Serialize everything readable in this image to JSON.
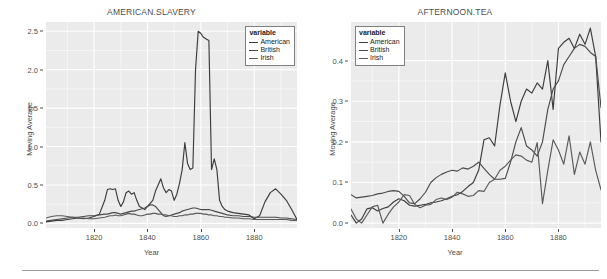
{
  "figure": {
    "divider_visible": true,
    "panel_bg": "#ebebeb",
    "grid_color": "#ffffff",
    "text_color": "#4d4d4d"
  },
  "legend": {
    "title": "variable",
    "entries": [
      {
        "label": "American",
        "color": "#3c3c3c"
      },
      {
        "label": "British",
        "color": "#4a4a4a"
      },
      {
        "label": "Irish",
        "color": "#5a5a5a"
      }
    ]
  },
  "chart_data": [
    {
      "type": "line",
      "title": "AMERICAN.SLAVERY",
      "xlabel": "Year",
      "ylabel": "Moving Average",
      "xlim": [
        1802,
        1896
      ],
      "ylim": [
        -0.06,
        2.62
      ],
      "xticks": [
        1820,
        1840,
        1860,
        1880
      ],
      "yticks": [
        0.0,
        0.5,
        1.0,
        1.5,
        2.0,
        2.5
      ],
      "ytick_labels": [
        "0.0",
        "0.5",
        "1.0",
        "1.5",
        "2.0",
        "2.5"
      ],
      "grid": true,
      "legend_position": "top-right-inside",
      "x": [
        1802,
        1804,
        1806,
        1808,
        1810,
        1812,
        1814,
        1816,
        1818,
        1820,
        1822,
        1824,
        1825,
        1826,
        1827,
        1828,
        1829,
        1830,
        1831,
        1832,
        1833,
        1834,
        1835,
        1836,
        1837,
        1838,
        1839,
        1840,
        1841,
        1842,
        1843,
        1844,
        1845,
        1846,
        1847,
        1848,
        1849,
        1850,
        1851,
        1852,
        1853,
        1854,
        1855,
        1856,
        1857,
        1858,
        1859,
        1860,
        1861,
        1862,
        1863,
        1864,
        1865,
        1866,
        1867,
        1868,
        1869,
        1870,
        1872,
        1874,
        1876,
        1878,
        1880,
        1882,
        1884,
        1886,
        1888,
        1890,
        1892,
        1894,
        1896
      ],
      "series": [
        {
          "name": "American",
          "values": [
            0.02,
            0.03,
            0.04,
            0.04,
            0.05,
            0.06,
            0.07,
            0.06,
            0.07,
            0.09,
            0.12,
            0.3,
            0.44,
            0.45,
            0.44,
            0.45,
            0.3,
            0.22,
            0.28,
            0.4,
            0.42,
            0.38,
            0.4,
            0.3,
            0.22,
            0.2,
            0.18,
            0.22,
            0.26,
            0.3,
            0.42,
            0.5,
            0.58,
            0.46,
            0.4,
            0.44,
            0.42,
            0.3,
            0.38,
            0.52,
            0.7,
            1.05,
            0.78,
            0.7,
            0.72,
            2.0,
            2.5,
            2.47,
            2.42,
            2.4,
            2.38,
            0.7,
            0.84,
            0.7,
            0.3,
            0.22,
            0.18,
            0.16,
            0.14,
            0.13,
            0.12,
            0.11,
            0.06,
            0.1,
            0.28,
            0.4,
            0.45,
            0.38,
            0.3,
            0.18,
            0.05
          ]
        },
        {
          "name": "British",
          "values": [
            0.03,
            0.04,
            0.05,
            0.06,
            0.07,
            0.08,
            0.08,
            0.09,
            0.1,
            0.1,
            0.11,
            0.12,
            0.12,
            0.13,
            0.14,
            0.14,
            0.13,
            0.12,
            0.13,
            0.14,
            0.15,
            0.16,
            0.16,
            0.17,
            0.18,
            0.19,
            0.2,
            0.22,
            0.24,
            0.24,
            0.22,
            0.18,
            0.14,
            0.1,
            0.09,
            0.1,
            0.11,
            0.12,
            0.13,
            0.14,
            0.16,
            0.17,
            0.18,
            0.19,
            0.2,
            0.2,
            0.19,
            0.18,
            0.18,
            0.18,
            0.18,
            0.17,
            0.16,
            0.15,
            0.14,
            0.13,
            0.12,
            0.11,
            0.1,
            0.1,
            0.09,
            0.09,
            0.08,
            0.08,
            0.08,
            0.08,
            0.08,
            0.07,
            0.07,
            0.06,
            0.05
          ]
        },
        {
          "name": "Irish",
          "values": [
            0.07,
            0.09,
            0.1,
            0.1,
            0.09,
            0.08,
            0.07,
            0.07,
            0.06,
            0.06,
            0.07,
            0.08,
            0.09,
            0.1,
            0.1,
            0.11,
            0.1,
            0.1,
            0.11,
            0.12,
            0.13,
            0.12,
            0.12,
            0.11,
            0.1,
            0.1,
            0.11,
            0.12,
            0.12,
            0.13,
            0.13,
            0.12,
            0.12,
            0.11,
            0.11,
            0.1,
            0.1,
            0.09,
            0.09,
            0.1,
            0.1,
            0.11,
            0.11,
            0.12,
            0.12,
            0.13,
            0.13,
            0.13,
            0.12,
            0.12,
            0.11,
            0.11,
            0.1,
            0.1,
            0.09,
            0.09,
            0.08,
            0.08,
            0.07,
            0.07,
            0.06,
            0.06,
            0.05,
            0.05,
            0.05,
            0.05,
            0.05,
            0.05,
            0.05,
            0.04,
            0.04
          ]
        }
      ]
    },
    {
      "type": "line",
      "title": "AFTERNOON.TEA",
      "xlabel": "Year",
      "ylabel": "Moving Average",
      "xlim": [
        1802,
        1896
      ],
      "ylim": [
        -0.012,
        0.495
      ],
      "xticks": [
        1820,
        1840,
        1860,
        1880
      ],
      "yticks": [
        0.0,
        0.1,
        0.2,
        0.3,
        0.4
      ],
      "ytick_labels": [
        "0.0",
        "0.1",
        "0.2",
        "0.3",
        "0.4"
      ],
      "grid": true,
      "legend_position": "top-left-inside",
      "x": [
        1802,
        1804,
        1806,
        1808,
        1810,
        1812,
        1814,
        1816,
        1818,
        1820,
        1822,
        1824,
        1826,
        1828,
        1830,
        1832,
        1834,
        1836,
        1838,
        1840,
        1842,
        1844,
        1846,
        1848,
        1850,
        1852,
        1854,
        1856,
        1858,
        1860,
        1862,
        1864,
        1866,
        1868,
        1870,
        1872,
        1874,
        1876,
        1878,
        1880,
        1882,
        1884,
        1886,
        1888,
        1890,
        1892,
        1894,
        1896
      ],
      "series": [
        {
          "name": "American",
          "values": [
            0.02,
            0.0,
            0.01,
            0.035,
            0.038,
            0.03,
            0.036,
            0.04,
            0.052,
            0.06,
            0.055,
            0.044,
            0.042,
            0.044,
            0.046,
            0.05,
            0.052,
            0.055,
            0.06,
            0.066,
            0.07,
            0.078,
            0.09,
            0.1,
            0.13,
            0.205,
            0.21,
            0.19,
            0.29,
            0.37,
            0.3,
            0.25,
            0.3,
            0.33,
            0.32,
            0.345,
            0.33,
            0.4,
            0.28,
            0.43,
            0.445,
            0.455,
            0.43,
            0.465,
            0.44,
            0.48,
            0.41,
            0.2
          ]
        },
        {
          "name": "British",
          "values": [
            0.07,
            0.062,
            0.064,
            0.066,
            0.068,
            0.072,
            0.074,
            0.078,
            0.08,
            0.078,
            0.066,
            0.05,
            0.048,
            0.06,
            0.076,
            0.1,
            0.112,
            0.12,
            0.126,
            0.13,
            0.128,
            0.136,
            0.133,
            0.14,
            0.15,
            0.135,
            0.12,
            0.108,
            0.108,
            0.11,
            0.15,
            0.2,
            0.235,
            0.19,
            0.18,
            0.165,
            0.2,
            0.28,
            0.33,
            0.35,
            0.39,
            0.41,
            0.43,
            0.44,
            0.435,
            0.42,
            0.41,
            0.285
          ]
        },
        {
          "name": "Irish",
          "values": [
            0.035,
            0.01,
            0.0,
            0.02,
            0.04,
            0.044,
            0.0,
            0.022,
            0.04,
            0.052,
            0.07,
            0.068,
            0.046,
            0.038,
            0.044,
            0.046,
            0.058,
            0.062,
            0.058,
            0.064,
            0.076,
            0.072,
            0.066,
            0.068,
            0.08,
            0.078,
            0.1,
            0.108,
            0.13,
            0.14,
            0.155,
            0.168,
            0.165,
            0.155,
            0.15,
            0.198,
            0.048,
            0.13,
            0.205,
            0.18,
            0.145,
            0.215,
            0.12,
            0.175,
            0.145,
            0.2,
            0.13,
            0.082
          ]
        }
      ]
    }
  ]
}
